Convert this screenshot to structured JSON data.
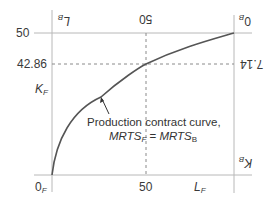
{
  "diagram": {
    "type": "edgeworth-box-production",
    "axes": {
      "left_origin": "0",
      "left_origin_sub": "F",
      "right_origin": "0",
      "right_origin_sub": "B",
      "y_left_label": "K",
      "y_left_label_sub": "F",
      "x_bottom_label": "L",
      "x_bottom_label_sub": "F",
      "y_right_label": "K",
      "y_right_label_sub": "B",
      "x_top_label": "L",
      "x_top_label_sub": "B"
    },
    "ticks": {
      "left_top": "50",
      "left_mid": "42.86",
      "bottom_mid": "50",
      "top_mid": "50",
      "right_mid": "7.14"
    },
    "caption": {
      "line1": "Production contract curve,",
      "line2_a": "MRTS",
      "line2_a_sub": "F",
      "line2_eq": " = ",
      "line2_b": "MRTS",
      "line2_b_sub": "B"
    },
    "colors": {
      "axis": "#b5b5b5",
      "curve": "#555555",
      "dashed": "#8a8a8a",
      "text": "#333333"
    }
  }
}
